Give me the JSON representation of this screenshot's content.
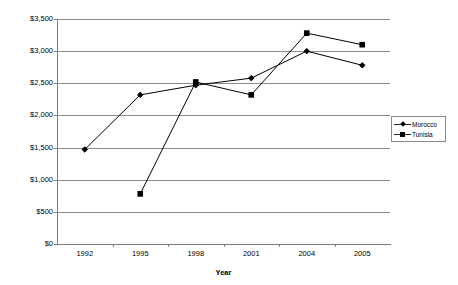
{
  "chart_data": {
    "type": "line",
    "title": "",
    "xlabel": "Year",
    "ylabel": "Value (in millions of US$)",
    "categories": [
      "1992",
      "1995",
      "1998",
      "2001",
      "2004",
      "2005"
    ],
    "ylim": [
      0,
      3500
    ],
    "ytick_step": 500,
    "ytick_labels": [
      "$3,500",
      "$3,000",
      "$2,500",
      "$2,000",
      "$1,500",
      "$1,000",
      "$500",
      "$0"
    ],
    "ytick_values": [
      3500,
      3000,
      2500,
      2000,
      1500,
      1000,
      500,
      0
    ],
    "grid": "horizontal",
    "legend_position": "right",
    "series": [
      {
        "name": "Morocco",
        "marker": "diamond",
        "color": "#000000",
        "values": [
          1470,
          2320,
          2470,
          2580,
          3000,
          2780
        ]
      },
      {
        "name": "Tunisia",
        "marker": "square",
        "color": "#000000",
        "values": [
          null,
          780,
          2520,
          2320,
          3280,
          3100
        ]
      }
    ]
  }
}
